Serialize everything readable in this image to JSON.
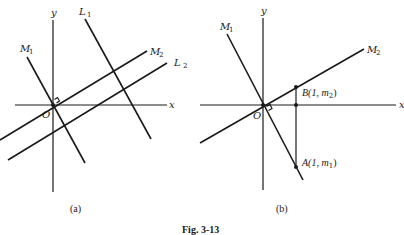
{
  "figure": {
    "caption": "Fig. 3-13"
  },
  "panel_a": {
    "caption": "(a)",
    "axis_x_label": "x",
    "axis_y_label": "y",
    "origin_label": "O",
    "lines": [
      {
        "name": "M",
        "sub": "1"
      },
      {
        "name": "L",
        "sub": "1"
      },
      {
        "name": "M",
        "sub": "2"
      },
      {
        "name": "L",
        "sub": "2"
      }
    ]
  },
  "panel_b": {
    "caption": "(b)",
    "axis_x_label": "x",
    "axis_y_label": "y",
    "origin_label": "O",
    "lines": [
      {
        "name": "M",
        "sub": "1"
      },
      {
        "name": "M",
        "sub": "2"
      }
    ],
    "points": {
      "B": {
        "label": "B(1, m",
        "sub": "2",
        "close": ")"
      },
      "A": {
        "label": "A(1, m",
        "sub": "1",
        "close": ")"
      }
    }
  },
  "colors": {
    "ink": "#1a1a1a",
    "background": "#ffffff"
  }
}
